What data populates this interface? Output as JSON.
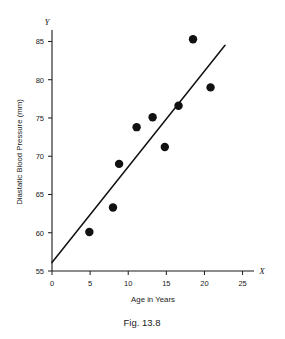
{
  "figure": {
    "caption": "Fig. 13.8"
  },
  "chart_data": {
    "type": "scatter",
    "title": "",
    "xlabel": "Age in Years",
    "ylabel": "Diastatic Blood Pressure (mm)",
    "x_axis_name": "X",
    "y_axis_name": "Y",
    "xlim": [
      0,
      26.5
    ],
    "ylim": [
      55,
      86.5
    ],
    "xticks": [
      0,
      5,
      10,
      15,
      20,
      25
    ],
    "yticks": [
      55,
      60,
      65,
      70,
      75,
      80,
      85
    ],
    "xtick_labels": [
      "0",
      "5",
      "10",
      "15",
      "20",
      "25"
    ],
    "ytick_labels": [
      "55",
      "60",
      "65",
      "70",
      "75",
      "80",
      "85"
    ],
    "grid": false,
    "legend": null,
    "point_color": "#111111",
    "line_color": "#111111",
    "points": [
      {
        "x": 4.9,
        "y": 60.1
      },
      {
        "x": 8.0,
        "y": 63.3
      },
      {
        "x": 8.8,
        "y": 69.0
      },
      {
        "x": 11.1,
        "y": 73.8
      },
      {
        "x": 13.2,
        "y": 75.1
      },
      {
        "x": 14.8,
        "y": 71.2
      },
      {
        "x": 16.6,
        "y": 76.6
      },
      {
        "x": 18.5,
        "y": 85.3
      },
      {
        "x": 20.8,
        "y": 79.0
      }
    ],
    "fit_line": {
      "label": "regression-line",
      "x0": 0.0,
      "y0": 56.1,
      "x1": 22.7,
      "y1": 84.5
    }
  }
}
